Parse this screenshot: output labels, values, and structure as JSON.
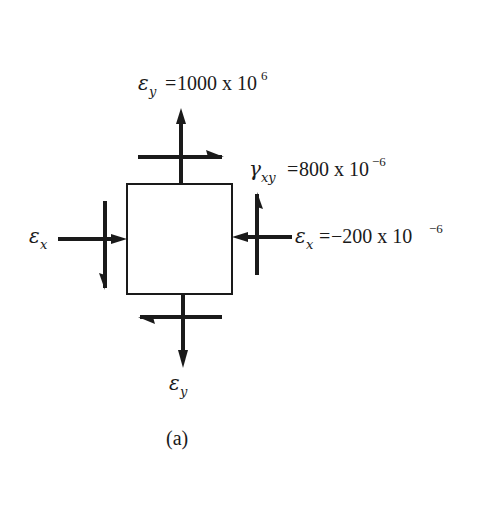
{
  "figure": {
    "caption": "(a)",
    "element": {
      "shape": "square",
      "description": "strain element"
    },
    "labels": {
      "top": {
        "symbol": "ε",
        "subscript": "y",
        "equals": " = ",
        "value": "1000 x 10",
        "exponent": "6"
      },
      "shear": {
        "symbol": "γ",
        "subscript": "xy",
        "equals": " = ",
        "value": "800 x 10",
        "exponent": "−6"
      },
      "right": {
        "symbol": "ε",
        "subscript": "x",
        "equals": " = ",
        "value": "−200 x 10",
        "exponent": "−6"
      },
      "left": {
        "symbol": "ε",
        "subscript": "x"
      },
      "bottom": {
        "symbol": "ε",
        "subscript": "y"
      }
    },
    "arrows": {
      "top_normal": "up",
      "bottom_normal": "down",
      "left_normal": "right (into element)",
      "right_normal": "left (into element)",
      "top_shear": "right",
      "bottom_shear": "left",
      "left_shear": "down",
      "right_shear": "up"
    },
    "colors": {
      "ink": "#1a1a1a",
      "background": "#ffffff"
    }
  }
}
